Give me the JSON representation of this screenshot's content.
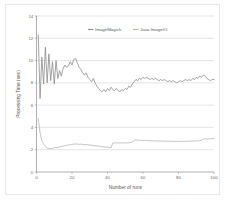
{
  "chart_data": {
    "type": "line",
    "title": "",
    "xlabel": "Number of runs",
    "ylabel": "Processing Time (sec)",
    "xlim": [
      0,
      100
    ],
    "ylim": [
      0,
      14
    ],
    "xticks": [
      0,
      20,
      40,
      60,
      80,
      100
    ],
    "yticks": [
      0,
      2,
      4,
      6,
      8,
      10,
      12,
      14
    ],
    "xtick_labels": [
      "0",
      "20",
      "40",
      "60",
      "80",
      "100"
    ],
    "ytick_labels": [
      "0",
      "2",
      "4",
      "6",
      "8",
      "10",
      "12",
      "14"
    ],
    "grid": "horizontal",
    "legend_position": "top-center",
    "series": [
      {
        "name": "ImageMagick",
        "color": "#8c8c8c",
        "x": [
          1,
          2,
          3,
          4,
          5,
          6,
          7,
          8,
          9,
          10,
          11,
          12,
          13,
          14,
          15,
          16,
          17,
          18,
          19,
          20,
          21,
          22,
          23,
          24,
          25,
          26,
          27,
          28,
          29,
          30,
          31,
          32,
          33,
          34,
          35,
          36,
          37,
          38,
          39,
          40,
          41,
          42,
          43,
          44,
          45,
          46,
          47,
          48,
          49,
          50,
          51,
          52,
          53,
          54,
          55,
          56,
          57,
          58,
          59,
          60,
          61,
          62,
          63,
          64,
          65,
          66,
          67,
          68,
          69,
          70,
          71,
          72,
          73,
          74,
          75,
          76,
          77,
          78,
          79,
          80,
          81,
          82,
          83,
          84,
          85,
          86,
          87,
          88,
          89,
          90,
          91,
          92,
          93,
          94,
          95,
          96,
          97,
          98,
          99,
          100
        ],
        "values": [
          12.3,
          6.6,
          10.3,
          7.9,
          11.2,
          8.0,
          10.6,
          8.2,
          9.9,
          7.9,
          10.0,
          8.4,
          9.1,
          8.6,
          9.3,
          9.6,
          9.4,
          9.5,
          9.9,
          9.6,
          10.1,
          10.2,
          9.8,
          9.4,
          9.2,
          8.9,
          8.7,
          8.9,
          8.5,
          8.3,
          8.1,
          8.4,
          8.0,
          7.7,
          7.5,
          7.3,
          7.2,
          7.4,
          7.2,
          7.5,
          7.3,
          7.6,
          7.4,
          7.3,
          7.5,
          7.3,
          7.2,
          7.4,
          7.3,
          7.5,
          7.4,
          7.7,
          7.6,
          7.9,
          8.1,
          8.3,
          8.2,
          8.4,
          8.3,
          8.5,
          8.4,
          8.5,
          8.4,
          8.3,
          8.4,
          8.3,
          8.4,
          8.3,
          8.2,
          8.3,
          8.2,
          8.3,
          8.2,
          8.1,
          8.2,
          8.1,
          8.2,
          8.1,
          8.0,
          8.1,
          8.2,
          8.1,
          8.2,
          8.3,
          8.2,
          8.3,
          8.2,
          8.4,
          8.3,
          8.5,
          8.4,
          8.6,
          8.5,
          8.7,
          8.6,
          8.4,
          8.3,
          8.2,
          8.3,
          8.3
        ]
      },
      {
        "name": "Java ImageIO",
        "color": "#b5b5b5",
        "x": [
          1,
          2,
          3,
          4,
          5,
          6,
          7,
          8,
          9,
          10,
          11,
          12,
          13,
          14,
          15,
          16,
          17,
          18,
          19,
          20,
          21,
          22,
          23,
          24,
          25,
          26,
          27,
          28,
          29,
          30,
          31,
          32,
          33,
          34,
          35,
          36,
          37,
          38,
          39,
          40,
          41,
          42,
          43,
          44,
          45,
          46,
          47,
          48,
          49,
          50,
          51,
          52,
          53,
          54,
          55,
          56,
          57,
          58,
          59,
          60,
          61,
          62,
          63,
          64,
          65,
          66,
          67,
          68,
          69,
          70,
          71,
          72,
          73,
          74,
          75,
          76,
          77,
          78,
          79,
          80,
          81,
          82,
          83,
          84,
          85,
          86,
          87,
          88,
          89,
          90,
          91,
          92,
          93,
          94,
          95,
          96,
          97,
          98,
          99,
          100
        ],
        "values": [
          4.8,
          3.5,
          2.8,
          2.5,
          2.3,
          2.15,
          2.1,
          2.12,
          2.1,
          2.18,
          2.2,
          2.2,
          2.25,
          2.3,
          2.32,
          2.35,
          2.4,
          2.42,
          2.45,
          2.48,
          2.5,
          2.52,
          2.5,
          2.48,
          2.5,
          2.48,
          2.45,
          2.46,
          2.44,
          2.42,
          2.4,
          2.38,
          2.36,
          2.34,
          2.32,
          2.3,
          2.28,
          2.26,
          2.24,
          2.22,
          2.2,
          2.18,
          2.6,
          2.62,
          2.6,
          2.62,
          2.6,
          2.62,
          2.6,
          2.62,
          2.6,
          2.62,
          2.65,
          2.68,
          2.85,
          2.88,
          2.86,
          2.84,
          2.85,
          2.83,
          2.82,
          2.83,
          2.81,
          2.8,
          2.81,
          2.79,
          2.8,
          2.78,
          2.79,
          2.77,
          2.78,
          2.77,
          2.76,
          2.77,
          2.75,
          2.76,
          2.75,
          2.74,
          2.75,
          2.74,
          2.75,
          2.74,
          2.76,
          2.75,
          2.77,
          2.76,
          2.78,
          2.77,
          2.79,
          2.78,
          2.8,
          2.82,
          2.85,
          2.95,
          2.98,
          2.96,
          2.97,
          2.98,
          2.99,
          3.0
        ]
      }
    ]
  },
  "legend": {
    "items": [
      {
        "label": "ImageMagick"
      },
      {
        "label": "Java ImageIO"
      }
    ]
  }
}
